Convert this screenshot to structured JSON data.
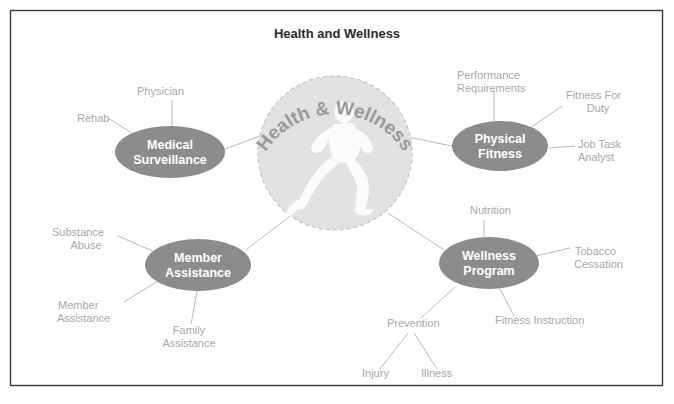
{
  "page": {
    "title": "Health and Wellness",
    "background_color": "#ffffff",
    "border_color": "#3a3a3a"
  },
  "hub": {
    "arc_label": "Health & Wellness",
    "icon": "running-figure-icon",
    "fill_color": "#e2e2e2",
    "border_style": "dashed",
    "center": {
      "x": 335,
      "y": 153
    },
    "radius": 77
  },
  "colors": {
    "node_fill": "#8c8c8c",
    "node_text": "#ffffff",
    "leaf_text": "#a8a8a8",
    "connector": "#b9b9b9",
    "title_text": "#2b2b2b"
  },
  "nodes": [
    {
      "id": "medical-surveillance",
      "label_line1": "Medical",
      "label_line2": "Surveillance",
      "cx": 170,
      "cy": 152,
      "rx": 55,
      "ry": 26
    },
    {
      "id": "physical-fitness",
      "label_line1": "Physical",
      "label_line2": "Fitness",
      "cx": 500,
      "cy": 146,
      "rx": 48,
      "ry": 25
    },
    {
      "id": "member-assistance",
      "label_line1": "Member",
      "label_line2": "Assistance",
      "cx": 198,
      "cy": 265,
      "rx": 53,
      "ry": 26
    },
    {
      "id": "wellness-program",
      "label_line1": "Wellness",
      "label_line2": "Program",
      "cx": 489,
      "cy": 263,
      "rx": 50,
      "ry": 26
    }
  ],
  "leaves": [
    {
      "id": "physician",
      "lines": [
        "Physician"
      ],
      "x": 137,
      "y": 95,
      "anchor": "start"
    },
    {
      "id": "rehab",
      "lines": [
        "Rehab"
      ],
      "x": 77,
      "y": 122,
      "anchor": "start"
    },
    {
      "id": "performance-req",
      "lines": [
        "Performance",
        "Requirements"
      ],
      "x": 457,
      "y": 79,
      "anchor": "start"
    },
    {
      "id": "fitness-for-duty",
      "lines": [
        "Fitness For",
        "Duty"
      ],
      "x": 566,
      "y": 99,
      "anchor": "start"
    },
    {
      "id": "job-task-analyst",
      "lines": [
        "Job Task",
        "Analyst"
      ],
      "x": 578,
      "y": 148,
      "anchor": "start"
    },
    {
      "id": "substance-abuse",
      "lines": [
        "Substance",
        "Abuse"
      ],
      "x": 52,
      "y": 236,
      "anchor": "start"
    },
    {
      "id": "member-assistance-leaf",
      "lines": [
        "Member",
        "Assistance"
      ],
      "x": 58,
      "y": 309,
      "anchor": "start"
    },
    {
      "id": "family-assistance",
      "lines": [
        "Family",
        "Assistance"
      ],
      "x": 168,
      "y": 334,
      "anchor": "start"
    },
    {
      "id": "nutrition",
      "lines": [
        "Nutrition"
      ],
      "x": 470,
      "y": 214,
      "anchor": "start"
    },
    {
      "id": "tobacco-cessation",
      "lines": [
        "Tobacco",
        "Cessation"
      ],
      "x": 575,
      "y": 255,
      "anchor": "start"
    },
    {
      "id": "fitness-instruction",
      "lines": [
        "Fitness Instruction"
      ],
      "x": 495,
      "y": 324,
      "anchor": "start"
    },
    {
      "id": "prevention",
      "lines": [
        "Prevention"
      ],
      "x": 387,
      "y": 327,
      "anchor": "start"
    },
    {
      "id": "injury",
      "lines": [
        "Injury"
      ],
      "x": 362,
      "y": 377,
      "anchor": "start"
    },
    {
      "id": "illness",
      "lines": [
        "Illness"
      ],
      "x": 421,
      "y": 377,
      "anchor": "start"
    }
  ]
}
